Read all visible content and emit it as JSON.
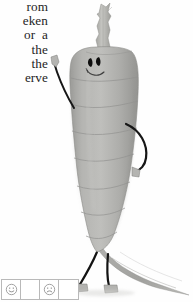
{
  "page": {
    "background_color": "#fefefe",
    "width": 193,
    "height": 302
  },
  "text_column": {
    "alignment": "right",
    "clipped_at_left_margin": true,
    "text_color": "#1d1d1d",
    "lines": [
      "rom",
      "eken",
      "or  a",
      "the",
      "the",
      "erve"
    ]
  },
  "figure": {
    "caption": "",
    "body_color": "#a9a9a7",
    "body_shadow_color": "#8e8e8c",
    "body_highlight_color": "#c2c2bf",
    "limb_color": "#1a1a1a",
    "stem_color": "#b8b8b4",
    "parts": {
      "stem_label": "carrot stem",
      "head_label": "carrot head",
      "face_label": "stitched face",
      "left_eye_label": "left eye",
      "right_eye_label": "right eye",
      "mouth_label": "smiling mouth",
      "body_label": "carrot body",
      "left_arm_label": "left arm",
      "right_arm_label": "right arm",
      "left_leg_label": "left leg",
      "right_leg_label": "right leg",
      "tail_label": "carrot tail"
    },
    "segment_count": 8
  },
  "icon_strip": {
    "border_color": "#b9b9b9",
    "cell_count": 4,
    "cells": [
      {
        "icon": "smiley-face-icon",
        "expression": "happy",
        "label": "happy face rating"
      },
      {
        "icon": "empty-cell",
        "expression": "",
        "label": "blank response box"
      },
      {
        "icon": "frowny-face-icon",
        "expression": "sad",
        "label": "sad face rating"
      },
      {
        "icon": "empty-cell",
        "expression": "",
        "label": "blank response box"
      }
    ]
  }
}
